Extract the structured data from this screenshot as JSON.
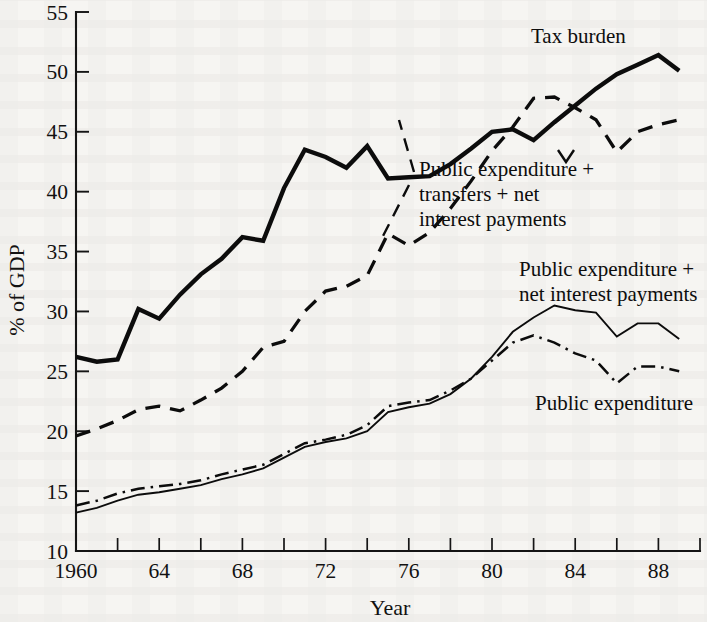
{
  "chart_data": {
    "type": "line",
    "title": "",
    "xlabel": "Year",
    "ylabel": "% of GDP",
    "xlim": [
      1960,
      1989
    ],
    "ylim": [
      10,
      55
    ],
    "ytick_step": 5,
    "xtick_labels": [
      "1960",
      "64",
      "68",
      "72",
      "76",
      "80",
      "84",
      "88"
    ],
    "xtick_values": [
      1960,
      1964,
      1968,
      1972,
      1976,
      1980,
      1984,
      1988
    ],
    "xtick_minor_step": 2,
    "ytick_labels": [
      "10",
      "15",
      "20",
      "25",
      "30",
      "35",
      "40",
      "45",
      "50",
      "55"
    ],
    "ytick_values": [
      10,
      15,
      20,
      25,
      30,
      35,
      40,
      45,
      50,
      55
    ],
    "grid": false,
    "legend_position": "inline-annotations",
    "x": [
      1960,
      1961,
      1962,
      1963,
      1964,
      1965,
      1966,
      1967,
      1968,
      1969,
      1970,
      1971,
      1972,
      1973,
      1974,
      1975,
      1976,
      1977,
      1978,
      1979,
      1980,
      1981,
      1982,
      1983,
      1984,
      1985,
      1986,
      1987,
      1988,
      1989
    ],
    "series": [
      {
        "name": "Tax burden",
        "style": "thick-solid",
        "values": [
          26.2,
          25.8,
          26.0,
          30.2,
          29.4,
          31.4,
          33.1,
          34.4,
          36.2,
          35.9,
          40.3,
          43.5,
          42.9,
          42.0,
          43.8,
          41.1,
          41.2,
          41.3,
          42.3,
          43.6,
          45.0,
          45.2,
          44.3,
          45.8,
          47.2,
          48.6,
          49.8,
          50.6,
          51.4,
          50.1
        ]
      },
      {
        "name": "Public expenditure + transfers + net interest payments",
        "style": "dashed",
        "values": [
          19.6,
          20.2,
          20.9,
          21.8,
          22.1,
          21.7,
          22.6,
          23.6,
          25.0,
          27.0,
          27.5,
          30.0,
          31.7,
          32.1,
          33.0,
          36.5,
          35.5,
          36.6,
          38.6,
          40.9,
          43.4,
          45.4,
          47.8,
          47.9,
          47.0,
          46.0,
          43.3,
          45.0,
          45.6,
          46.0
        ]
      },
      {
        "name": "Public expenditure + net interest payments",
        "style": "thin-solid",
        "values": [
          13.2,
          13.6,
          14.2,
          14.7,
          14.9,
          15.2,
          15.5,
          16.0,
          16.4,
          16.9,
          17.8,
          18.7,
          19.1,
          19.4,
          20.0,
          21.6,
          22.0,
          22.3,
          23.1,
          24.4,
          26.2,
          28.3,
          29.5,
          30.5,
          30.1,
          29.9,
          27.9,
          29.0,
          29.0,
          27.7
        ]
      },
      {
        "name": "Public expenditure",
        "style": "dash-dot",
        "values": [
          13.8,
          14.2,
          14.8,
          15.2,
          15.4,
          15.6,
          15.9,
          16.4,
          16.8,
          17.2,
          18.1,
          19.0,
          19.3,
          19.7,
          20.5,
          22.1,
          22.4,
          22.6,
          23.4,
          24.4,
          25.9,
          27.4,
          28.0,
          27.4,
          26.5,
          25.9,
          24.0,
          25.4,
          25.4,
          25.0
        ]
      }
    ],
    "annotations": [
      {
        "id": "tax-burden",
        "lines": [
          "Tax burden"
        ],
        "x": 531,
        "y": 43
      },
      {
        "id": "public-expenditure-transfers-net-interest",
        "lines": [
          "Public expenditure +",
          "transfers + net",
          "interest payments"
        ],
        "x": 419,
        "y": 176
      },
      {
        "id": "public-expenditure-net-interest",
        "lines": [
          "Public expenditure +",
          "net interest payments"
        ],
        "x": 519,
        "y": 276
      },
      {
        "id": "public-expenditure",
        "lines": [
          "Public expenditure"
        ],
        "x": 535,
        "y": 410
      }
    ]
  }
}
